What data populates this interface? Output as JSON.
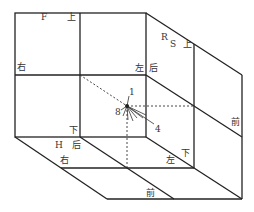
{
  "diagram": {
    "type": "cube-2x2-oblique",
    "colors": {
      "line": "#222222",
      "dashed": "#333333",
      "text": "#333333"
    },
    "face_labels": [
      {
        "id": "F",
        "text": "F",
        "x": 41,
        "y": 13
      },
      {
        "id": "top1",
        "text": "上",
        "x": 67,
        "y": 13
      },
      {
        "id": "right1",
        "text": "右",
        "x": 17,
        "y": 63
      },
      {
        "id": "R",
        "text": "R",
        "x": 161,
        "y": 33
      },
      {
        "id": "S",
        "text": "S",
        "x": 170,
        "y": 40
      },
      {
        "id": "top2",
        "text": "上",
        "x": 183,
        "y": 40
      },
      {
        "id": "left1",
        "text": "左",
        "x": 135,
        "y": 64
      },
      {
        "id": "back1",
        "text": "后",
        "x": 149,
        "y": 64
      },
      {
        "id": "label1",
        "text": "1",
        "x": 129,
        "y": 88
      },
      {
        "id": "label8",
        "text": "8",
        "x": 115,
        "y": 108
      },
      {
        "id": "label4",
        "text": "4",
        "x": 155,
        "y": 125
      },
      {
        "id": "front1",
        "text": "前",
        "x": 231,
        "y": 118
      },
      {
        "id": "bottom1",
        "text": "下",
        "x": 69,
        "y": 126
      },
      {
        "id": "H",
        "text": "H",
        "x": 55,
        "y": 141
      },
      {
        "id": "back2",
        "text": "后",
        "x": 72,
        "y": 141
      },
      {
        "id": "right2",
        "text": "右",
        "x": 60,
        "y": 156
      },
      {
        "id": "left2",
        "text": "左",
        "x": 166,
        "y": 156
      },
      {
        "id": "bottom2",
        "text": "下",
        "x": 181,
        "y": 149
      },
      {
        "id": "front2",
        "text": "前",
        "x": 146,
        "y": 189
      }
    ]
  }
}
